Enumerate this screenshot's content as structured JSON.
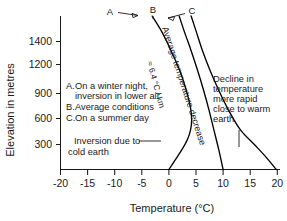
{
  "chart_data": {
    "type": "line",
    "title": "",
    "xlabel": "Temperature (°C)",
    "ylabel": "Elevation in metres",
    "xlim": [
      -20,
      20
    ],
    "ylim": [
      0,
      1550
    ],
    "grid": false,
    "legend_position": "inside-left",
    "xticks": [
      "-20",
      "-15",
      "-10",
      "-5",
      "0",
      "5",
      "10",
      "15",
      "20"
    ],
    "xtick_values": [
      -20,
      -15,
      -10,
      -5,
      0,
      5,
      10,
      15,
      20
    ],
    "yticks": [
      "1400",
      "1200",
      "900",
      "600",
      "300"
    ],
    "ytick_values": [
      1400,
      1200,
      900,
      600,
      300
    ],
    "series": [
      {
        "name": "A",
        "label": "On a winter night, inversion in lower air",
        "points": [
          {
            "t": -3.1,
            "h": 1550
          },
          {
            "t": -1.4,
            "h": 1400
          },
          {
            "t": 0.4,
            "h": 1200
          },
          {
            "t": 2.0,
            "h": 1000
          },
          {
            "t": 3.2,
            "h": 800
          },
          {
            "t": 4.0,
            "h": 620
          },
          {
            "t": 4.2,
            "h": 500
          },
          {
            "t": 4.0,
            "h": 400
          },
          {
            "t": 3.4,
            "h": 300
          },
          {
            "t": 2.4,
            "h": 200
          },
          {
            "t": 1.2,
            "h": 100
          },
          {
            "t": 0.0,
            "h": 0
          }
        ]
      },
      {
        "name": "B",
        "label": "Average conditions",
        "points": [
          {
            "t": 1.9,
            "h": 1550
          },
          {
            "t": 2.8,
            "h": 1400
          },
          {
            "t": 4.1,
            "h": 1200
          },
          {
            "t": 5.3,
            "h": 1000
          },
          {
            "t": 6.4,
            "h": 800
          },
          {
            "t": 7.4,
            "h": 600
          },
          {
            "t": 8.3,
            "h": 400
          },
          {
            "t": 9.2,
            "h": 200
          },
          {
            "t": 10.0,
            "h": 0
          }
        ]
      },
      {
        "name": "C",
        "label": "On a summer day",
        "points": [
          {
            "t": 4.1,
            "h": 1550
          },
          {
            "t": 5.0,
            "h": 1400
          },
          {
            "t": 6.2,
            "h": 1200
          },
          {
            "t": 7.6,
            "h": 1000
          },
          {
            "t": 9.2,
            "h": 800
          },
          {
            "t": 11.0,
            "h": 600
          },
          {
            "t": 13.2,
            "h": 400
          },
          {
            "t": 15.8,
            "h": 250
          },
          {
            "t": 18.0,
            "h": 120
          },
          {
            "t": 19.8,
            "h": 0
          }
        ]
      }
    ],
    "annotations": [
      {
        "name": "lapse-rate",
        "text": "Average temperature decrease",
        "rotation": -72
      },
      {
        "name": "lapse-rate-value",
        "text": "≈ 6.4 °C / km",
        "rotation": -75
      },
      {
        "name": "warm-earth",
        "text": "Decline in temperature more rapid close to warm earth"
      },
      {
        "name": "cold-earth",
        "text": "Inversion due to cold earth"
      }
    ],
    "curve_labels": [
      "A",
      "B",
      "C"
    ]
  },
  "legend": {
    "entries": [
      {
        "key": "A.",
        "text": "On a winter night,",
        "text2": "inversion in lower air"
      },
      {
        "key": "B.",
        "text": "Average conditions",
        "text2": ""
      },
      {
        "key": "C.",
        "text": "On a summer day",
        "text2": ""
      }
    ]
  },
  "axes": {
    "x_title": "Temperature (°C)",
    "y_title": "Elevation in metres",
    "x_ticks": [
      "-20",
      "-15",
      "-10",
      "-5",
      "0",
      "5",
      "10",
      "15",
      "20"
    ],
    "y_ticks": [
      "1400",
      "1200",
      "900",
      "600",
      "300"
    ]
  },
  "annotations": {
    "rot_main": "Average temperature decrease",
    "rot_value": "≈ 6.4 °C / km",
    "warm_line1": "Decline in",
    "warm_line2": "temperature",
    "warm_line3": "more rapid",
    "warm_line4": "close to warm",
    "warm_line5": "earth",
    "cold_line1": "Inversion due to",
    "cold_line2": "cold earth"
  },
  "curve_labels": {
    "a": "A",
    "b": "B",
    "c": "C"
  },
  "colors": {
    "ink": "#1a1a1a",
    "curve": "#000000",
    "background": "#ffffff"
  }
}
